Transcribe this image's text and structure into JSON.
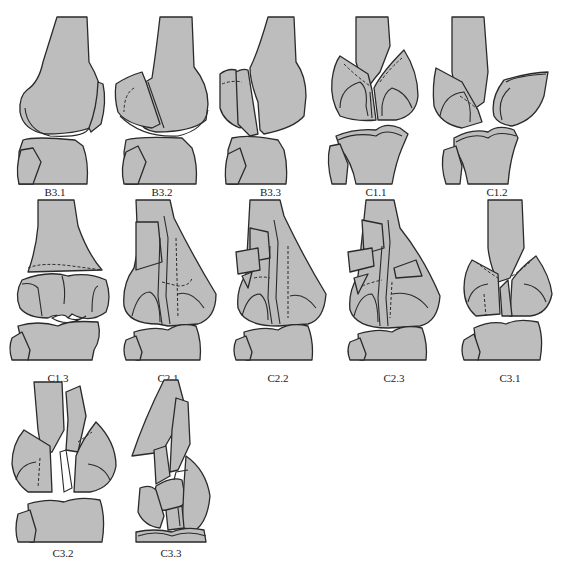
{
  "figure": {
    "colors": {
      "bone_fill": "#bdbdbd",
      "outline": "#2a2a2a",
      "background": "#ffffff"
    },
    "rows": [
      {
        "panels": [
          {
            "label": "B3.1",
            "view": "lateral",
            "description": "Hoffa fracture, lateral posterior condyle, single coronal fragment"
          },
          {
            "label": "B3.2",
            "view": "lateral",
            "description": "Coronal fracture of posterior condyle with dashed medial fracture line"
          },
          {
            "label": "B3.3",
            "view": "lateral",
            "description": "Combined coronal fracture of both posterior condyles, displaced"
          },
          {
            "label": "C1.1",
            "view": "AP",
            "description": "T/Y-shaped intercondylar fracture, slightly displaced"
          },
          {
            "label": "C1.2",
            "view": "AP",
            "description": "T/Y-shaped intercondylar fracture, markedly displaced condyles"
          }
        ]
      },
      {
        "panels": [
          {
            "label": "C1.3",
            "view": "AP",
            "description": "T-shaped epiphyseal fracture with transverse dashed metaphyseal line"
          },
          {
            "label": "C2.1",
            "view": "AP",
            "description": "Intact metaphyseal wedge with simple articular split"
          },
          {
            "label": "C2.2",
            "view": "AP",
            "description": "Fragmented metaphyseal wedge"
          },
          {
            "label": "C2.3",
            "view": "AP",
            "description": "Complex metaphyseal fragmentation"
          },
          {
            "label": "C3.1",
            "view": "AP",
            "description": "Metaphyseal simple, articular multifragmentary"
          }
        ]
      },
      {
        "panels": [
          {
            "label": "C3.2",
            "view": "AP",
            "description": "Metaphyseal wedge, articular multifragmentary"
          },
          {
            "label": "C3.3",
            "view": "AP",
            "description": "Metaphyseal and articular multifragmentary, comminuted"
          }
        ]
      }
    ]
  }
}
